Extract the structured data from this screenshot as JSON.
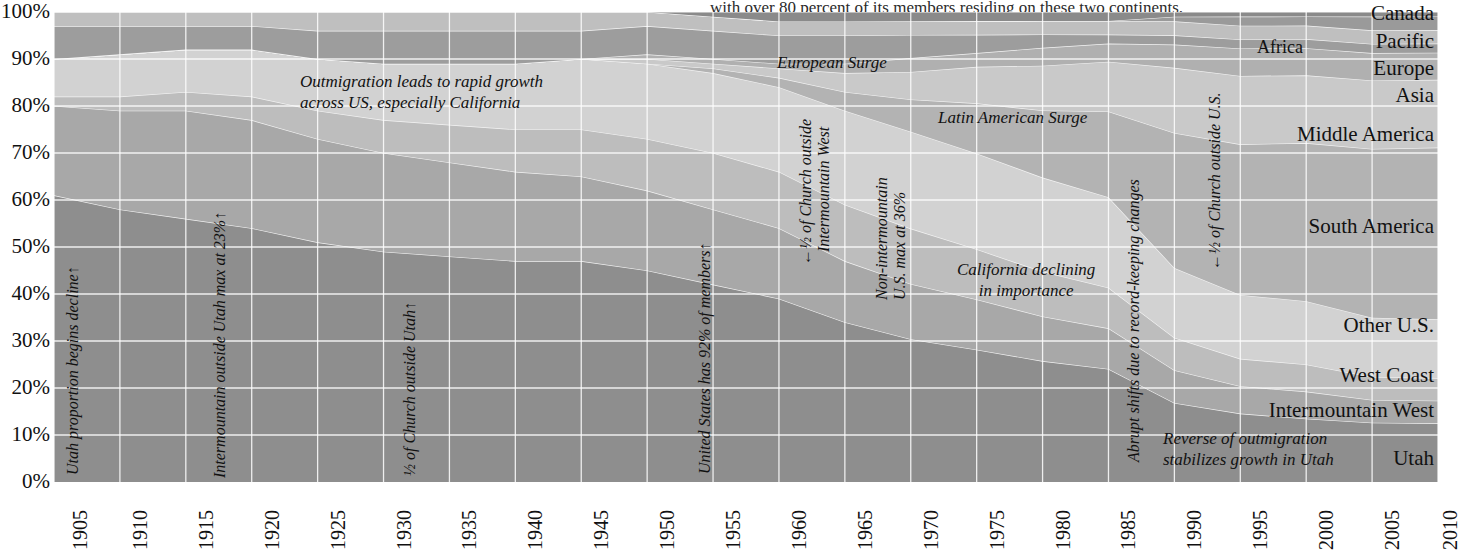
{
  "top_note": "with over 80 percent of its members residing on these two continents.",
  "chart_data": {
    "type": "area",
    "title": "",
    "xlabel": "",
    "ylabel": "",
    "xlim": [
      1905,
      2010
    ],
    "ylim": [
      0,
      100
    ],
    "grid": true,
    "stacked": true,
    "normalized_percent": true,
    "legend_position": "right-inline",
    "x_ticks": [
      "1905",
      "1910",
      "1915",
      "1920",
      "1925",
      "1930",
      "1935",
      "1940",
      "1945",
      "1950",
      "1955",
      "1960",
      "1965",
      "1970",
      "1975",
      "1980",
      "1985",
      "1990",
      "1995",
      "2000",
      "2005",
      "2010"
    ],
    "y_ticks": [
      "0%",
      "10%",
      "20%",
      "30%",
      "40%",
      "50%",
      "60%",
      "70%",
      "80%",
      "90%",
      "100%"
    ],
    "x": [
      1905,
      1910,
      1915,
      1920,
      1925,
      1930,
      1935,
      1940,
      1945,
      1950,
      1955,
      1960,
      1965,
      1970,
      1975,
      1980,
      1985,
      1990,
      1995,
      2000,
      2005,
      2010
    ],
    "series": [
      {
        "name": "Utah",
        "color": "#8e8e8e",
        "values": [
          61,
          58,
          56,
          54,
          51,
          49,
          48,
          47,
          47,
          45,
          42,
          39,
          34,
          31,
          29,
          27,
          25,
          17,
          15,
          14,
          13,
          13
        ]
      },
      {
        "name": "Intermountain West",
        "color": "#a8a8a8",
        "values": [
          19,
          21,
          23,
          23,
          22,
          21,
          20,
          19,
          18,
          17,
          16,
          15,
          13,
          12,
          11,
          10,
          9,
          7,
          6,
          6,
          5,
          5
        ]
      },
      {
        "name": "West Coast",
        "color": "#bdbdbd",
        "values": [
          2,
          3,
          4,
          5,
          6,
          7,
          8,
          9,
          10,
          11,
          12,
          12,
          12,
          12,
          11,
          10,
          9,
          7,
          6,
          6,
          5,
          5
        ]
      },
      {
        "name": "Other U.S.",
        "color": "#d2d2d2",
        "values": [
          8,
          9,
          9,
          10,
          11,
          12,
          13,
          14,
          15,
          16,
          17,
          18,
          20,
          21,
          21,
          21,
          20,
          15,
          14,
          14,
          13,
          13
        ]
      },
      {
        "name": "South America",
        "color": "#b3b3b3",
        "values": [
          0,
          0,
          0,
          0,
          0,
          0,
          0,
          0,
          0,
          0,
          1,
          2,
          4,
          7,
          11,
          15,
          19,
          29,
          33,
          35,
          37,
          38
        ]
      },
      {
        "name": "Middle America",
        "color": "#c9c9c9",
        "values": [
          0,
          0,
          0,
          0,
          0,
          0,
          0,
          0,
          0,
          1,
          1,
          2,
          4,
          6,
          8,
          10,
          11,
          14,
          15,
          15,
          15,
          15
        ]
      },
      {
        "name": "Asia",
        "color": "#b0b0b0",
        "values": [
          0,
          0,
          0,
          0,
          0,
          0,
          0,
          0,
          0,
          1,
          1,
          1,
          2,
          3,
          3,
          4,
          4,
          5,
          6,
          6,
          6,
          6
        ]
      },
      {
        "name": "Europe",
        "color": "#9d9d9d",
        "values": [
          7,
          6,
          5,
          5,
          6,
          7,
          7,
          7,
          6,
          6,
          6,
          6,
          6,
          5,
          4,
          3,
          2,
          2,
          2,
          2,
          2,
          2
        ]
      },
      {
        "name": "Pacific",
        "color": "#bfbfbf",
        "values": [
          3,
          3,
          3,
          3,
          4,
          4,
          4,
          4,
          4,
          3,
          3,
          3,
          3,
          3,
          3,
          3,
          3,
          3,
          3,
          3,
          3,
          3
        ]
      },
      {
        "name": "Africa",
        "color": "#9a9a9a",
        "values": [
          0,
          0,
          0,
          0,
          0,
          0,
          0,
          0,
          0,
          0,
          0,
          0,
          0,
          0,
          0,
          0,
          0,
          1,
          2,
          2,
          3,
          3
        ]
      },
      {
        "name": "Canada",
        "color": "#8a8a8a",
        "values": [
          0,
          0,
          0,
          0,
          0,
          0,
          0,
          0,
          0,
          0,
          1,
          2,
          2,
          2,
          2,
          2,
          2,
          1,
          1,
          1,
          1,
          1
        ]
      }
    ],
    "annotations": [
      {
        "text": "Utah proportion begins decline",
        "orientation": "vertical",
        "arrow": "up"
      },
      {
        "text": "Intermountain outside Utah max at 23%",
        "orientation": "vertical",
        "arrow": "up"
      },
      {
        "text": "½ of Church outside Utah",
        "orientation": "vertical",
        "arrow": "up"
      },
      {
        "text": "Outmigration leads to rapid growth across US, especially California",
        "orientation": "horizontal",
        "arrow": "none"
      },
      {
        "text": "United States has 92% of members",
        "orientation": "vertical",
        "arrow": "up"
      },
      {
        "text": "European Surge",
        "orientation": "horizontal",
        "arrow": "none"
      },
      {
        "text": "½ of Church outside Intermountain West",
        "orientation": "vertical",
        "arrow": "down"
      },
      {
        "text": "Non-intermountain U.S. max at 36%",
        "orientation": "vertical",
        "arrow": "none"
      },
      {
        "text": "Latin American Surge",
        "orientation": "horizontal",
        "arrow": "none"
      },
      {
        "text": "California declining in importance",
        "orientation": "horizontal",
        "arrow": "none"
      },
      {
        "text": "Abrupt shifts due to record-keeping changes",
        "orientation": "vertical",
        "arrow": "none"
      },
      {
        "text": "½ of Church outside U.S.",
        "orientation": "vertical",
        "arrow": "down"
      },
      {
        "text": "Reverse of outmigration stabilizes growth in Utah",
        "orientation": "horizontal",
        "arrow": "none"
      }
    ]
  },
  "y_axis": {
    "ticks": [
      "100%",
      "90%",
      "80%",
      "70%",
      "60%",
      "50%",
      "40%",
      "30%",
      "20%",
      "10%",
      "0%"
    ]
  },
  "x_axis": {
    "ticks": [
      "1905",
      "1910",
      "1915",
      "1920",
      "1925",
      "1930",
      "1935",
      "1940",
      "1945",
      "1950",
      "1955",
      "1960",
      "1965",
      "1970",
      "1975",
      "1980",
      "1985",
      "1990",
      "1995",
      "2000",
      "2005",
      "2010"
    ]
  },
  "categories": {
    "canada": "Canada",
    "pacific": "Pacific",
    "africa": "Africa",
    "europe": "Europe",
    "asia": "Asia",
    "middle_america": "Middle America",
    "south_america": "South America",
    "other_us": "Other U.S.",
    "west_coast": "West Coast",
    "intermountain_west": "Intermountain West",
    "utah": "Utah"
  },
  "annotations": {
    "a1": "Utah proportion begins decline",
    "a2": "Intermountain outside Utah max at 23%",
    "a3": "½ of Church outside Utah",
    "a4_line1": "Outmigration leads to rapid growth",
    "a4_line2": "across US, especially California",
    "a5": "United States has 92% of members",
    "a6": "European Surge",
    "a7_line1": "½ of Church outside",
    "a7_line2": "Intermountain West",
    "a8_line1": "Non-intermountain",
    "a8_line2": "U.S. max at 36%",
    "a9": "Latin American Surge",
    "a10_line1": "California declining",
    "a10_line2": "in importance",
    "a11": "Abrupt shifts due to record-keeping changes",
    "a12": "½ of Church outside U.S.",
    "a13_line1": "Reverse of outmigration",
    "a13_line2": "stabilizes growth in Utah"
  },
  "colors": {
    "grid": "#ffffff",
    "text": "#111111",
    "background": "#ffffff"
  }
}
